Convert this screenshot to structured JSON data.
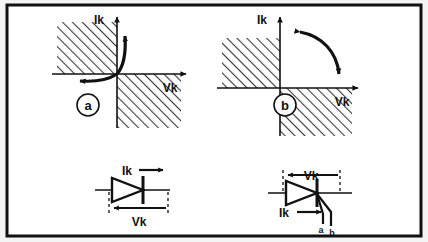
{
  "figure": {
    "background_color": "#f4f4f4",
    "panel_color": "#ffffff",
    "border_color": "#111111",
    "ink_color": "#111111",
    "hatch_color": "#3a3a3a"
  },
  "diagrams": [
    {
      "id": "a",
      "tag": "a",
      "y_axis_label": "Ik",
      "x_axis_label": "Vk",
      "hatched_quadrants": [
        "upper-left",
        "lower-right"
      ],
      "arrows": [
        {
          "name": "curve-up",
          "direction": "up",
          "quadrant": "upper-right"
        },
        {
          "name": "curve-left",
          "direction": "left",
          "quadrant": "lower-left"
        }
      ]
    },
    {
      "id": "b",
      "tag": "b",
      "y_axis_label": "Ik",
      "x_axis_label": "Vk",
      "hatched_quadrants": [
        "upper-left",
        "lower-right"
      ],
      "arrows": [
        {
          "name": "arc-start",
          "direction": "left",
          "quadrant": "upper-right"
        },
        {
          "name": "arc-end",
          "direction": "down",
          "quadrant": "upper-right"
        }
      ]
    }
  ],
  "symbols": [
    {
      "id": "diode",
      "type": "diode",
      "current_label": "Ik",
      "voltage_label": "Vk",
      "current_arrow_direction": "right",
      "voltage_arrow_direction": "left",
      "gate_terminals": []
    },
    {
      "id": "triac",
      "type": "triac",
      "current_label": "Ik",
      "voltage_label": "Vk",
      "current_arrow_direction": "right",
      "voltage_arrow_direction": "left",
      "gate_terminals": [
        "a",
        "b"
      ]
    }
  ]
}
